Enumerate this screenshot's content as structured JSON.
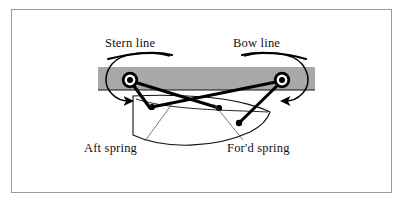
{
  "figure": {
    "background_color": "#ffffff",
    "frame_color": "#9a9a9a",
    "quay_color": "#a8a8a8",
    "ink_color": "#000000",
    "leader_color": "#555555"
  },
  "labels": {
    "stern_line": "Stern line",
    "bow_line": "Bow line",
    "aft_spring": "Aft spring",
    "ford_spring": "For'd spring"
  },
  "diagram_data": {
    "type": "diagram",
    "subject": "Ship moored alongside a quay showing four mooring lines",
    "elements": [
      {
        "name": "quay-band",
        "kind": "horizontal-band",
        "color": "#a8a8a8"
      },
      {
        "name": "bollard-left",
        "kind": "concentric-circles",
        "x": 130,
        "y": 80
      },
      {
        "name": "bollard-right",
        "kind": "concentric-circles",
        "x": 282,
        "y": 80
      },
      {
        "name": "ship-hull",
        "kind": "outline",
        "bow": "right",
        "stern": "left"
      },
      {
        "name": "stern-line",
        "kind": "mooring-rope",
        "from": "bollard-left",
        "to": "hull-forward"
      },
      {
        "name": "bow-line",
        "kind": "mooring-rope",
        "from": "bollard-right",
        "to": "hull-aft"
      },
      {
        "name": "aft-spring",
        "kind": "mooring-rope",
        "from": "bollard-left",
        "to": "hull-near-stern"
      },
      {
        "name": "ford-spring",
        "kind": "mooring-rope",
        "from": "bollard-right",
        "to": "hull-near-bow"
      },
      {
        "name": "stern-arrow",
        "kind": "curved-arrow",
        "points_to": "bollard-left"
      },
      {
        "name": "bow-arrow",
        "kind": "curved-arrow",
        "points_to": "bollard-right"
      }
    ]
  }
}
